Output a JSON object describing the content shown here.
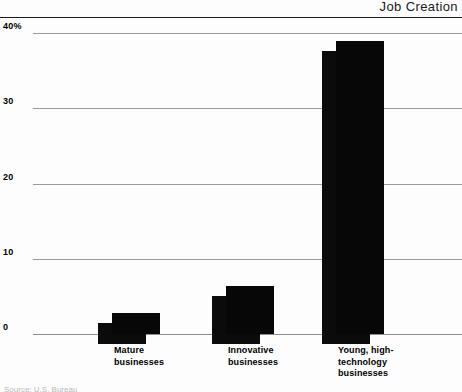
{
  "header": {
    "title": "Job Creation"
  },
  "footer": {
    "source": "Source: U.S. Bureau"
  },
  "chart_data": {
    "type": "bar",
    "title": "Job Creation",
    "xlabel": "",
    "ylabel": "",
    "ylim": [
      0,
      40
    ],
    "grid": true,
    "legend": "none",
    "y_ticks": [
      {
        "value": 40,
        "label": "40%"
      },
      {
        "value": 30,
        "label": "30"
      },
      {
        "value": 20,
        "label": "20"
      },
      {
        "value": 10,
        "label": "10"
      },
      {
        "value": 0,
        "label": "0"
      }
    ],
    "categories": [
      "Mature\nbusinesses",
      "Innovative\nbusinesses",
      "Young, high-\ntechnology\nbusinesses"
    ],
    "values": [
      2.8,
      6.4,
      39.0
    ],
    "bar_color": "#070707",
    "shadow_color": "#0b0b0b",
    "gridline_color": "#9a9a9a"
  }
}
